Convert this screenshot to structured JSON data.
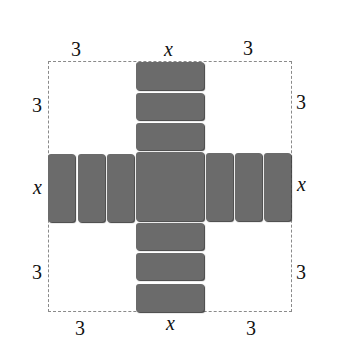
{
  "diagram": {
    "title": "",
    "tile_color": "#6b6b6b",
    "border_color": "#8a8a8a",
    "labels": {
      "top_left": "3",
      "top_center": "x",
      "top_right": "3",
      "left_top": "3",
      "left_center": "x",
      "left_bottom": "3",
      "right_top": "3",
      "right_center": "x",
      "right_bottom": "3",
      "bottom_left": "3",
      "bottom_center": "x",
      "bottom_right": "3"
    },
    "tiles": {
      "center": "x²",
      "top": [
        "x",
        "x",
        "x"
      ],
      "bottom": [
        "x",
        "x",
        "x"
      ],
      "left": [
        "x",
        "x",
        "x"
      ],
      "right": [
        "x",
        "x",
        "x"
      ]
    }
  }
}
